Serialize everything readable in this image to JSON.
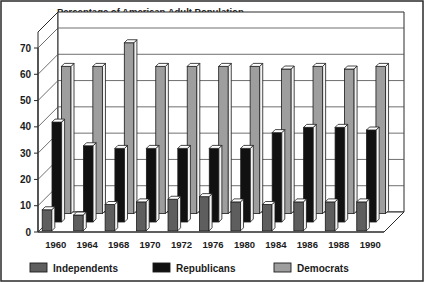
{
  "chart_data": {
    "type": "bar",
    "title": "Percentage of American Adult Population",
    "xlabel": "",
    "ylabel": "",
    "ylim": [
      0,
      70
    ],
    "yticks": [
      0,
      10,
      20,
      30,
      40,
      50,
      60,
      70
    ],
    "grid": true,
    "legend_position": "bottom",
    "style": "3d-grouped-bar",
    "categories": [
      "1960",
      "1964",
      "1968",
      "1970",
      "1972",
      "1976",
      "1980",
      "1984",
      "1986",
      "1988",
      "1990"
    ],
    "series": [
      {
        "name": "Independents",
        "color": "#5e5e5e",
        "values": [
          8,
          6,
          10,
          11,
          12,
          13,
          11,
          10,
          11,
          11,
          11
        ]
      },
      {
        "name": "Republicans",
        "color": "#111111",
        "values": [
          38,
          29,
          28,
          28,
          28,
          28,
          28,
          34,
          36,
          36,
          35
        ]
      },
      {
        "name": "Democrats",
        "color": "#9e9e9e",
        "values": [
          56,
          56,
          65,
          56,
          56,
          56,
          56,
          55,
          56,
          55,
          56
        ]
      }
    ]
  },
  "legend": {
    "items": [
      {
        "label": "Independents",
        "color": "#5e5e5e"
      },
      {
        "label": "Republicans",
        "color": "#111111"
      },
      {
        "label": "Democrats",
        "color": "#9e9e9e"
      }
    ]
  },
  "colors": {
    "independents": "#5e5e5e",
    "republicans": "#111111",
    "democrats": "#9e9e9e",
    "axis": "#2a2a2a",
    "background": "#ffffff",
    "side_face": "#f2f2f2",
    "top_face": "#ffffff"
  }
}
